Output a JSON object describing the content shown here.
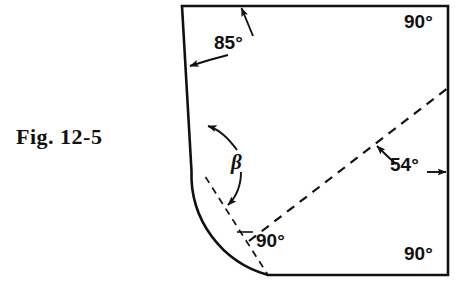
{
  "figure": {
    "caption": "Fig. 12-5",
    "background_color": "#ffffff",
    "line_color": "#111111",
    "labels": {
      "top_left_angle": "85°",
      "top_right_angle": "90°",
      "diagonal_angle": "54°",
      "fillet_angle": "β",
      "perpendicular_angle": "90°",
      "bottom_right_angle": "90°"
    },
    "geometry": {
      "outline": "closed profile with slanted left side, square top-right and bottom-right corners, and a tangent fillet arc joining the left side to the bottom edge",
      "dashed_diagonal": "construction line from the fillet region to the right edge",
      "dashed_radius": "radius construction line crossing the diagonal at 90°"
    }
  }
}
